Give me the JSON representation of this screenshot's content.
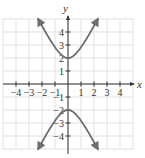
{
  "chart_data": {
    "type": "line",
    "title": "",
    "xlabel": "x",
    "ylabel": "y",
    "xlim": [
      -5,
      5
    ],
    "ylim": [
      -5,
      5
    ],
    "grid": true,
    "x_ticks": [
      -4,
      -3,
      -2,
      -1,
      1,
      2,
      3,
      4
    ],
    "y_ticks": [
      -4,
      -3,
      -2,
      -1,
      1,
      2,
      3,
      4
    ],
    "x_tick_labels": [
      "-4",
      "-3",
      "-2",
      "-1",
      "1",
      "2",
      "3",
      "4"
    ],
    "y_tick_labels": [
      "-4",
      "-3",
      "-2",
      "-1",
      "1",
      "2",
      "3",
      "4"
    ],
    "equation": "y^2/4 - x^2 = 1",
    "series": [
      {
        "name": "upper branch",
        "x": [
          -2.3,
          -2,
          -1.5,
          -1,
          -0.5,
          0,
          0.5,
          1,
          1.5,
          2,
          2.3
        ],
        "y": [
          5.0,
          4.47,
          3.61,
          2.83,
          2.24,
          2,
          2.24,
          2.83,
          3.61,
          4.47,
          5.0
        ],
        "arrows": "both"
      },
      {
        "name": "lower branch",
        "x": [
          -2.3,
          -2,
          -1.5,
          -1,
          -0.5,
          0,
          0.5,
          1,
          1.5,
          2,
          2.3
        ],
        "y": [
          -5.0,
          -4.47,
          -3.61,
          -2.83,
          -2.24,
          -2,
          -2.24,
          -2.83,
          -3.61,
          -4.47,
          -5.0
        ],
        "arrows": "both"
      }
    ],
    "vertices": [
      [
        0,
        2
      ],
      [
        0,
        -2
      ]
    ]
  },
  "colors": {
    "grid": "#d9d9d9",
    "axis": "#333333",
    "curve": "#6e6e6e",
    "background": "#ffffff"
  }
}
